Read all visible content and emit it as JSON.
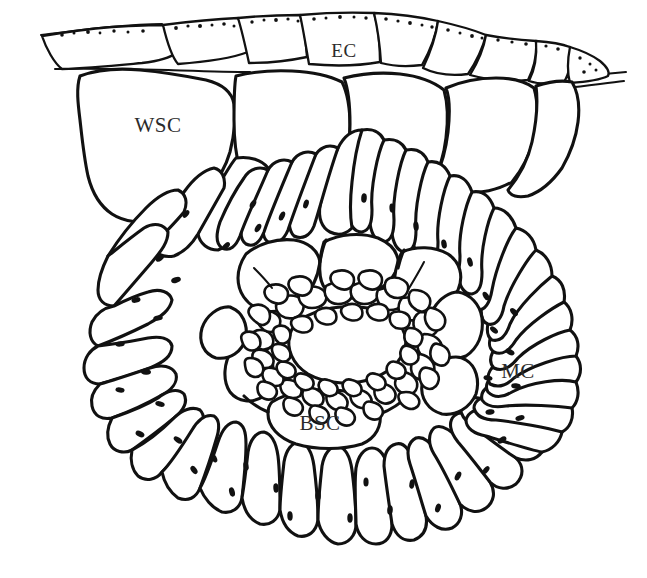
{
  "figure": {
    "domain": "diagram",
    "kind": "botanical-line-drawing",
    "background_color": "#ffffff",
    "ink_color": "#111111",
    "label_color": "#2b2b2b",
    "width": 647,
    "height": 578
  },
  "labels": [
    {
      "id": "ec",
      "text": "EC",
      "x": 344,
      "y": 57,
      "anchor": "middle",
      "meaning": "epidermal cell"
    },
    {
      "id": "wsc",
      "text": "WSC",
      "x": 158,
      "y": 132,
      "anchor": "middle",
      "meaning": "water storage cell"
    },
    {
      "id": "mc",
      "text": "MC",
      "x": 518,
      "y": 378,
      "anchor": "middle",
      "meaning": "mesophyll cell"
    },
    {
      "id": "bsc",
      "text": "BSC",
      "x": 320,
      "y": 430,
      "anchor": "middle",
      "meaning": "bundle sheath cell"
    }
  ],
  "tissue_layers": [
    {
      "id": "epidermis",
      "label_ref": "ec",
      "description": "outermost row of stippled cuticularized cells along the top margin",
      "cell_count": 9
    },
    {
      "id": "hypodermis",
      "label_ref": "wsc",
      "description": "large thin-walled water storage cells beneath the epidermis",
      "cell_count": 5
    },
    {
      "id": "mesophyll",
      "label_ref": "mc",
      "description": "radially elongated chlorenchyma cells forming a wreath around the bundle sheath",
      "cell_count": 38
    },
    {
      "id": "bundle_sheath",
      "label_ref": "bsc",
      "description": "inner ring of large bundle sheath cells enclosing the vascular bundle",
      "cell_count": 8
    },
    {
      "id": "vascular_bundle",
      "label_ref": null,
      "description": "central ring of small dense vascular and sclerenchyma cells enclosing a lacuna",
      "cell_count": 46
    }
  ],
  "features": {
    "stipple_description": "fine dark dots along the outer cuticle of the epidermal cells",
    "chloroplast_description": "small dark lens-shaped bodies along the radial walls of the mesophyll cells",
    "central_lacuna": "open white cavity at the centre of the vascular ring"
  }
}
